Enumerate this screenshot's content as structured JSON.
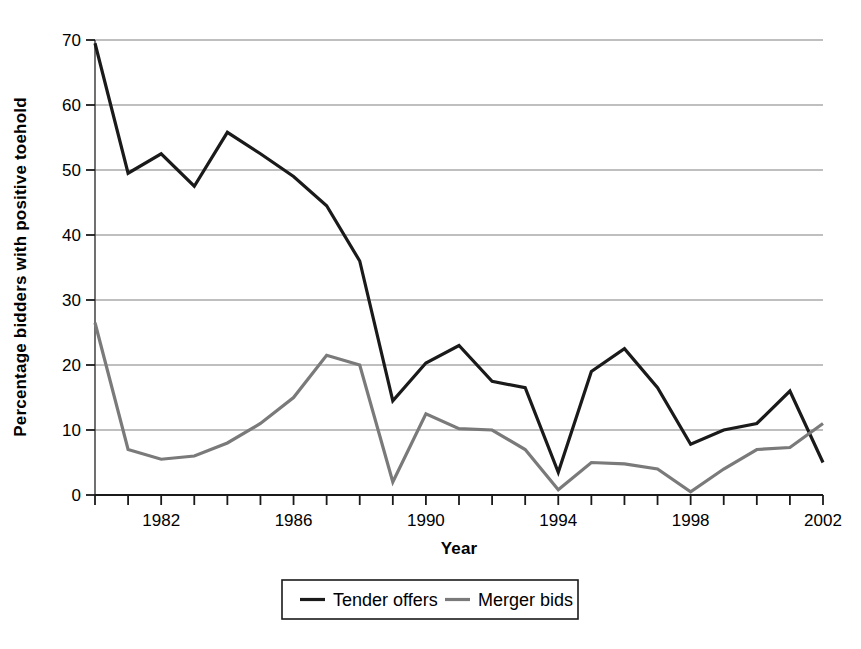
{
  "chart_data": {
    "type": "line",
    "title": "",
    "xlabel": "Year",
    "ylabel": "Percentage bidders with positive toehold",
    "xlim": [
      1980,
      2002
    ],
    "ylim": [
      0,
      70
    ],
    "ytick_step": 10,
    "xtick_step": 1,
    "xtick_label_step": 4,
    "grid": "horizontal",
    "legend_position": "bottom-center",
    "x": [
      1980,
      1981,
      1982,
      1983,
      1984,
      1985,
      1986,
      1987,
      1988,
      1989,
      1990,
      1991,
      1992,
      1993,
      1994,
      1995,
      1996,
      1997,
      1998,
      1999,
      2000,
      2001,
      2002
    ],
    "xticks": [
      1980,
      1981,
      1982,
      1983,
      1984,
      1985,
      1986,
      1987,
      1988,
      1989,
      1990,
      1991,
      1992,
      1993,
      1994,
      1995,
      1996,
      1997,
      1998,
      1999,
      2000,
      2001,
      2002
    ],
    "xtick_labels": [
      "",
      "",
      "1982",
      "",
      "",
      "",
      "1986",
      "",
      "",
      "",
      "1990",
      "",
      "",
      "",
      "1994",
      "",
      "",
      "",
      "1998",
      "",
      "",
      "",
      "2002"
    ],
    "yticks": [
      0,
      10,
      20,
      30,
      40,
      50,
      60,
      70
    ],
    "ytick_labels": [
      "0",
      "10",
      "20",
      "30",
      "40",
      "50",
      "60",
      "70"
    ],
    "series": [
      {
        "name": "Tender offers",
        "color": "#1a1a1a",
        "width": 3.2,
        "values": [
          69.5,
          49.5,
          52.5,
          47.5,
          55.8,
          52.5,
          49.0,
          44.5,
          36.0,
          14.5,
          20.3,
          23.0,
          17.5,
          16.5,
          3.5,
          19.0,
          22.5,
          16.5,
          7.8,
          10.0,
          11.0,
          16.0,
          5.0
        ]
      },
      {
        "name": "Merger bids",
        "color": "#7a7a7a",
        "width": 3.2,
        "values": [
          26.5,
          7.0,
          5.5,
          6.0,
          8.0,
          11.0,
          15.0,
          21.5,
          20.0,
          2.0,
          12.5,
          10.2,
          10.0,
          7.0,
          0.8,
          5.0,
          4.8,
          4.0,
          0.5,
          4.0,
          7.0,
          7.3,
          11.0
        ]
      }
    ],
    "legend": [
      {
        "label": "Tender offers",
        "color": "#1a1a1a"
      },
      {
        "label": "Merger bids",
        "color": "#7a7a7a"
      }
    ]
  }
}
